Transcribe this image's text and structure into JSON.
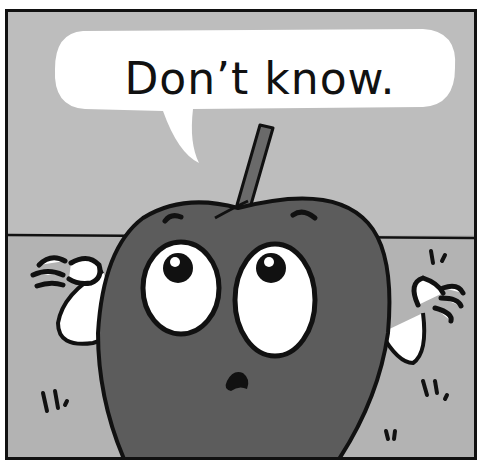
{
  "comic_panel": {
    "speech_bubble": {
      "text": "Don’t know."
    },
    "character": {
      "name": "apple",
      "expression": "confused-shrug"
    },
    "colors": {
      "border": "#111111",
      "wall": "#bdbdbd",
      "floor": "#b3b3b3",
      "apple_body": "#5c5c5c",
      "bubble": "#ffffff"
    }
  }
}
